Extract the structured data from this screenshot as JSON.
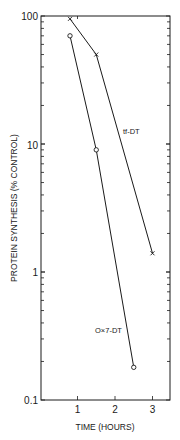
{
  "chart_data": {
    "type": "line",
    "title": "",
    "xlabel": "TIME (HOURS)",
    "ylabel": "PROTEIN SYNTHESIS (% CONTROL)",
    "xlim": [
      0,
      3.4
    ],
    "ylim": [
      0.1,
      100
    ],
    "yscale": "log",
    "grid": false,
    "legend": "inline labels",
    "x_ticks": [
      1,
      2,
      3
    ],
    "x_tick_labels": [
      "1",
      "2",
      "3"
    ],
    "y_ticks": [
      0.1,
      1,
      10,
      100
    ],
    "y_tick_labels": [
      "0.1",
      "1",
      "10",
      "100"
    ],
    "series": [
      {
        "name": "tf-DT",
        "marker": "x",
        "x": [
          0.8,
          1.5,
          3.0
        ],
        "values": [
          95,
          50,
          1.4
        ]
      },
      {
        "name": "O×7-DT",
        "marker": "o",
        "x": [
          0.8,
          1.5,
          2.5
        ],
        "values": [
          70,
          9,
          0.18
        ]
      }
    ],
    "annotations": [
      {
        "text": "tf-DT",
        "near_series": "tf-DT"
      },
      {
        "text": "O×7-DT",
        "near_series": "O×7-DT"
      }
    ]
  },
  "labels": {
    "series_a": "tf-DT",
    "series_b": "O×7-DT",
    "xlabel": "TIME (HOURS)",
    "ylabel": "PROTEIN SYNTHESIS (% CONTROL)",
    "y100": "100",
    "y10": "10",
    "y1": "1",
    "y01": "0.1",
    "x1": "1",
    "x2": "2",
    "x3": "3"
  },
  "colors": {
    "ink": "#1a1a1a",
    "background": "#ffffff"
  }
}
